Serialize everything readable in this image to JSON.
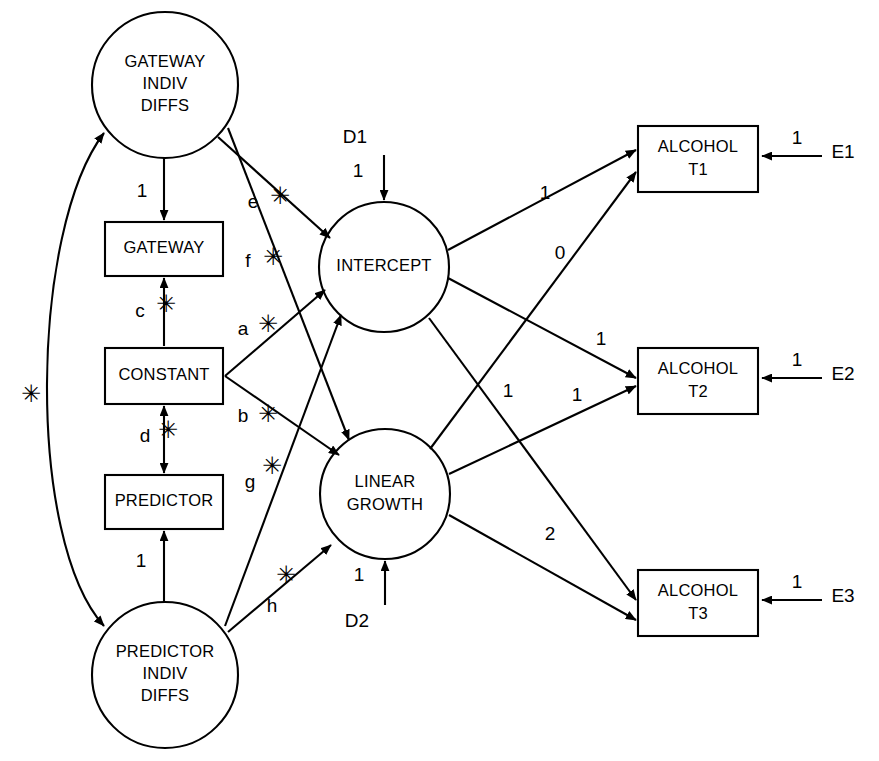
{
  "diagram": {
    "stroke_color": "#000000",
    "background_color": "#ffffff"
  },
  "latent_circles": [
    {
      "id": "gateway-indiv-diffs",
      "lines": [
        "GATEWAY",
        "INDIV",
        "DIFFS"
      ],
      "cx": 165,
      "cy": 85,
      "r": 73
    },
    {
      "id": "intercept",
      "lines": [
        "INTERCEPT"
      ],
      "cx": 384,
      "cy": 267,
      "r": 65
    },
    {
      "id": "linear-growth",
      "lines": [
        "LINEAR",
        "GROWTH"
      ],
      "cx": 385,
      "cy": 494,
      "r": 65
    },
    {
      "id": "predictor-indiv-diffs",
      "lines": [
        "PREDICTOR",
        "INDIV",
        "DIFFS"
      ],
      "cx": 165,
      "cy": 675,
      "r": 73
    }
  ],
  "observed_boxes": [
    {
      "id": "gateway",
      "lines": [
        "GATEWAY"
      ],
      "x": 105,
      "y": 222,
      "w": 118,
      "h": 54
    },
    {
      "id": "constant",
      "lines": [
        "CONSTANT"
      ],
      "x": 105,
      "y": 348,
      "w": 118,
      "h": 56
    },
    {
      "id": "predictor",
      "lines": [
        "PREDICTOR"
      ],
      "x": 105,
      "y": 475,
      "w": 118,
      "h": 54
    },
    {
      "id": "alcohol-t1",
      "lines": [
        "ALCOHOL",
        "T1"
      ],
      "x": 638,
      "y": 126,
      "w": 120,
      "h": 66
    },
    {
      "id": "alcohol-t2",
      "lines": [
        "ALCOHOL",
        "T2"
      ],
      "x": 638,
      "y": 348,
      "w": 120,
      "h": 66
    },
    {
      "id": "alcohol-t3",
      "lines": [
        "ALCOHOL",
        "T3"
      ],
      "x": 638,
      "y": 570,
      "w": 120,
      "h": 66
    }
  ],
  "residual_terms": [
    {
      "id": "d1",
      "label": "D1",
      "x": 355,
      "y": 138
    },
    {
      "id": "d2",
      "label": "D2",
      "x": 357,
      "y": 622
    },
    {
      "id": "e1",
      "label": "E1",
      "x": 843,
      "y": 153
    },
    {
      "id": "e2",
      "label": "E2",
      "x": 843,
      "y": 375
    },
    {
      "id": "e3",
      "label": "E3",
      "x": 843,
      "y": 597
    }
  ],
  "free_parameters": [
    {
      "id": "path-c",
      "label": "c",
      "x": 140,
      "y": 312,
      "star_x": 166,
      "star_y": 305,
      "desc": "constant to gateway"
    },
    {
      "id": "path-d",
      "label": "d",
      "x": 145,
      "y": 437,
      "star_x": 168,
      "star_y": 431,
      "desc": "constant to predictor"
    },
    {
      "id": "path-e",
      "label": "e",
      "x": 253,
      "y": 203,
      "star_x": 280,
      "star_y": 197,
      "desc": "gateway indiv diffs to intercept"
    },
    {
      "id": "path-f",
      "label": "f",
      "x": 248,
      "y": 262,
      "star_x": 273,
      "star_y": 258,
      "desc": "gateway indiv diffs to linear growth"
    },
    {
      "id": "path-a",
      "label": "a",
      "x": 243,
      "y": 330,
      "star_x": 268,
      "star_y": 325,
      "desc": "constant to intercept mean"
    },
    {
      "id": "path-b",
      "label": "b",
      "x": 243,
      "y": 417,
      "star_x": 268,
      "star_y": 415,
      "desc": "constant to linear growth mean"
    },
    {
      "id": "path-g",
      "label": "g",
      "x": 250,
      "y": 483,
      "star_x": 272,
      "star_y": 467,
      "desc": "predictor indiv diffs to intercept"
    },
    {
      "id": "path-h",
      "label": "h",
      "x": 272,
      "y": 607,
      "star_x": 286,
      "star_y": 576,
      "desc": "predictor indiv diffs to linear growth"
    },
    {
      "id": "covariance-star",
      "label": "",
      "x": 0,
      "y": 0,
      "star_x": 31,
      "star_y": 395,
      "desc": "gateway-predictor indiv diffs covariance"
    }
  ],
  "fixed_coefficients": [
    {
      "id": "gateway-loading",
      "label": "1",
      "x": 142,
      "y": 192
    },
    {
      "id": "predictor-loading",
      "label": "1",
      "x": 141,
      "y": 562
    },
    {
      "id": "d1-loading",
      "label": "1",
      "x": 358,
      "y": 172
    },
    {
      "id": "d2-loading",
      "label": "1",
      "x": 359,
      "y": 576
    },
    {
      "id": "e1-loading",
      "label": "1",
      "x": 797,
      "y": 139
    },
    {
      "id": "e2-loading",
      "label": "1",
      "x": 797,
      "y": 361
    },
    {
      "id": "e3-loading",
      "label": "1",
      "x": 797,
      "y": 583
    },
    {
      "id": "intercept-to-t1",
      "label": "1",
      "x": 545,
      "y": 194
    },
    {
      "id": "growth-to-t1",
      "label": "0",
      "x": 560,
      "y": 254
    },
    {
      "id": "intercept-to-t2",
      "label": "1",
      "x": 601,
      "y": 340
    },
    {
      "id": "growth-to-t2",
      "label": "1",
      "x": 577,
      "y": 396
    },
    {
      "id": "intercept-to-t3",
      "label": "1",
      "x": 508,
      "y": 392
    },
    {
      "id": "growth-to-t3",
      "label": "2",
      "x": 550,
      "y": 535
    }
  ],
  "connections": [
    {
      "id": "gateway-indiv-to-gateway",
      "type": "single-arrow",
      "from": "gateway-indiv-diffs",
      "to": "gateway",
      "coefficient": "1"
    },
    {
      "id": "constant-to-gateway",
      "type": "double-arrow",
      "from": "constant",
      "to": "gateway",
      "coefficient": "c"
    },
    {
      "id": "constant-to-predictor",
      "type": "double-arrow",
      "from": "constant",
      "to": "predictor",
      "coefficient": "d"
    },
    {
      "id": "predictor-indiv-to-predictor",
      "type": "single-arrow",
      "from": "predictor-indiv-diffs",
      "to": "predictor",
      "coefficient": "1"
    },
    {
      "id": "gateway-indiv-to-intercept",
      "type": "single-arrow",
      "from": "gateway-indiv-diffs",
      "to": "intercept",
      "coefficient": "e"
    },
    {
      "id": "gateway-indiv-to-growth",
      "type": "single-arrow",
      "from": "gateway-indiv-diffs",
      "to": "linear-growth",
      "coefficient": "f"
    },
    {
      "id": "constant-to-intercept",
      "type": "single-arrow",
      "from": "constant",
      "to": "intercept",
      "coefficient": "a"
    },
    {
      "id": "constant-to-growth",
      "type": "single-arrow",
      "from": "constant",
      "to": "linear-growth",
      "coefficient": "b"
    },
    {
      "id": "predictor-indiv-to-intercept",
      "type": "single-arrow",
      "from": "predictor-indiv-diffs",
      "to": "intercept",
      "coefficient": "g"
    },
    {
      "id": "predictor-indiv-to-growth",
      "type": "single-arrow",
      "from": "predictor-indiv-diffs",
      "to": "linear-growth",
      "coefficient": "h"
    },
    {
      "id": "indiv-diffs-covariance",
      "type": "curved-double-arrow",
      "from": "gateway-indiv-diffs",
      "to": "predictor-indiv-diffs",
      "coefficient": "*"
    },
    {
      "id": "d1-to-intercept",
      "type": "single-arrow",
      "from": "d1",
      "to": "intercept",
      "coefficient": "1"
    },
    {
      "id": "d2-to-growth",
      "type": "single-arrow",
      "from": "d2",
      "to": "linear-growth",
      "coefficient": "1"
    },
    {
      "id": "intercept-to-alcohol-t1",
      "type": "single-arrow",
      "from": "intercept",
      "to": "alcohol-t1",
      "coefficient": "1"
    },
    {
      "id": "intercept-to-alcohol-t2",
      "type": "single-arrow",
      "from": "intercept",
      "to": "alcohol-t2",
      "coefficient": "1"
    },
    {
      "id": "intercept-to-alcohol-t3",
      "type": "single-arrow",
      "from": "intercept",
      "to": "alcohol-t3",
      "coefficient": "1"
    },
    {
      "id": "growth-to-alcohol-t1",
      "type": "single-arrow",
      "from": "linear-growth",
      "to": "alcohol-t1",
      "coefficient": "0"
    },
    {
      "id": "growth-to-alcohol-t2",
      "type": "single-arrow",
      "from": "linear-growth",
      "to": "alcohol-t2",
      "coefficient": "1"
    },
    {
      "id": "growth-to-alcohol-t3",
      "type": "single-arrow",
      "from": "linear-growth",
      "to": "alcohol-t3",
      "coefficient": "2"
    },
    {
      "id": "e1-to-alcohol-t1",
      "type": "single-arrow",
      "from": "e1",
      "to": "alcohol-t1",
      "coefficient": "1"
    },
    {
      "id": "e2-to-alcohol-t2",
      "type": "single-arrow",
      "from": "e2",
      "to": "alcohol-t2",
      "coefficient": "1"
    },
    {
      "id": "e3-to-alcohol-t3",
      "type": "single-arrow",
      "from": "e3",
      "to": "alcohol-t3",
      "coefficient": "1"
    }
  ],
  "star_glyph": "✳"
}
